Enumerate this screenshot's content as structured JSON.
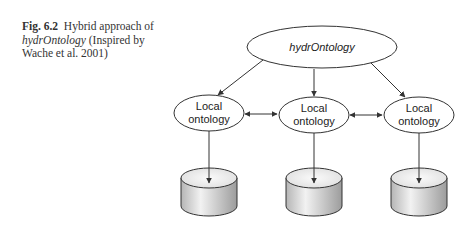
{
  "caption": {
    "figure_label": "Fig. 6.2",
    "text_part1": "Hybrid approach of",
    "italic_term": "hydrOntology",
    "text_part2": "(Inspired by Wache et al. 2001)"
  },
  "diagram": {
    "global_node": {
      "label": "hydrOntology"
    },
    "local_nodes": [
      {
        "line1": "Local",
        "line2": "ontology"
      },
      {
        "line1": "Local",
        "line2": "ontology"
      },
      {
        "line1": "Local",
        "line2": "ontology"
      }
    ],
    "data_sources": [
      {
        "shape": "cylinder"
      },
      {
        "shape": "cylinder"
      },
      {
        "shape": "cylinder"
      }
    ],
    "colors": {
      "stroke": "#333333",
      "cylinder_top": "#ececec",
      "cylinder_side_light": "#f0f0f0",
      "cylinder_side_dark": "#a8a8a8"
    }
  }
}
